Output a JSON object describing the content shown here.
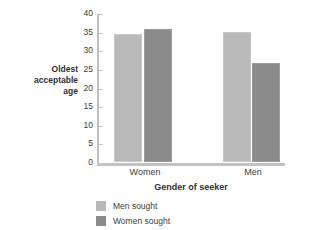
{
  "chart_data": {
    "type": "bar",
    "title": "",
    "xlabel": "Gender of seeker",
    "ylabel": "Oldest acceptable age",
    "categories": [
      "Women",
      "Men"
    ],
    "series": [
      {
        "name": "Men sought",
        "values": [
          34.5,
          35.0
        ],
        "color": "#b9b9b9"
      },
      {
        "name": "Women sought",
        "values": [
          35.6,
          26.5
        ],
        "color": "#8b8b8b"
      }
    ],
    "ylim": [
      0,
      40
    ],
    "yticks": [
      0,
      5,
      10,
      15,
      20,
      25,
      30,
      35,
      40
    ],
    "ytick_labels": [
      "0",
      "5",
      "10",
      "15",
      "20",
      "25",
      "30",
      "35",
      "40"
    ],
    "grid": false,
    "legend_position": "bottom-left"
  },
  "axes": {
    "y_title_lines": [
      "Oldest",
      "acceptable",
      "age"
    ],
    "x_title": "Gender of seeker"
  },
  "legend": {
    "entries": [
      {
        "label": "Men sought",
        "color": "#b9b9b9"
      },
      {
        "label": "Women sought",
        "color": "#8b8b8b"
      }
    ]
  }
}
